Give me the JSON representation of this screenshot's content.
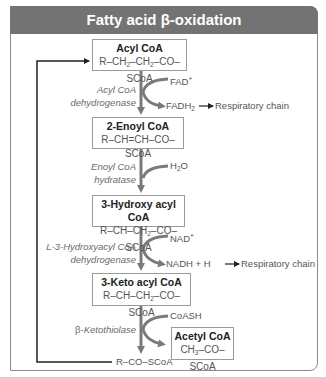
{
  "title": "Fatty acid β-oxidation",
  "colors": {
    "header_bg": "#737373",
    "header_text": "#ffffff",
    "arrow": "#7a7a7a",
    "loop_line": "#222222",
    "box_border": "#9a9a9a"
  },
  "intermediates": [
    {
      "name": "Acyl CoA",
      "formula_parts": [
        "R–CH",
        "2",
        "–CH",
        "2",
        "–CO–SCoA"
      ]
    },
    {
      "name": "2-Enoyl CoA",
      "formula": "R–CH=CH–CO–SCoA"
    },
    {
      "name": "3-Hydroxy acyl CoA",
      "formula_parts": [
        "R–CH–CH",
        "2",
        "–CO–SCoA"
      ]
    },
    {
      "name": "3-Keto acyl CoA",
      "formula_parts": [
        "R–CH–CH",
        "2",
        "–CO–SCoA"
      ]
    }
  ],
  "steps": [
    {
      "enzyme_line1": "Acyl CoA",
      "enzyme_line2": "dehydrogenase",
      "input": "FAD",
      "input_sup": "+",
      "output": "FADH",
      "output_sub": "2",
      "output_destination": "Respiratory chain"
    },
    {
      "enzyme_line1": "Enoyl CoA",
      "enzyme_line2": "hydratase",
      "input": "H",
      "input_sub": "2",
      "input_tail": "O"
    },
    {
      "enzyme_line1": "L-3-Hydroxyacyl CoA",
      "enzyme_line2": "dehydrogenase",
      "input": "NAD",
      "input_sup": "+",
      "output": "NADH + H",
      "output_destination": "Respiratory chain"
    },
    {
      "enzyme_prefix": "β-",
      "enzyme_line1": "Ketothiolase",
      "input": "CoASH"
    }
  ],
  "products": {
    "acetyl_coa": {
      "name": "Acetyl CoA",
      "formula_parts": [
        "CH",
        "3",
        "–CO–SCoA"
      ]
    },
    "recycled": "R–CO–SCoA"
  }
}
